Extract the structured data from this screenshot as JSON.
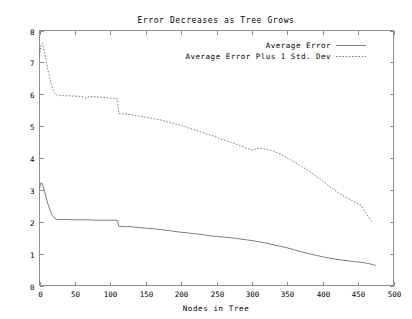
{
  "chart_data": {
    "type": "line",
    "title": "Error Decreases as Tree Grows",
    "xlabel": "Nodes in Tree",
    "ylabel": "",
    "xlim": [
      0,
      500
    ],
    "ylim": [
      0,
      8
    ],
    "xticks": [
      0,
      50,
      100,
      150,
      200,
      250,
      300,
      350,
      400,
      450,
      500
    ],
    "yticks": [
      0,
      1,
      2,
      3,
      4,
      5,
      6,
      7,
      8
    ],
    "grid": false,
    "legend_position": "top-right",
    "series": [
      {
        "name": "Average Error",
        "style": "solid",
        "color": "#6e6e6e",
        "x": [
          0,
          2,
          4,
          6,
          9,
          12,
          15,
          18,
          21,
          24,
          30,
          40,
          50,
          60,
          70,
          80,
          90,
          100,
          106,
          110,
          112,
          120,
          130,
          140,
          150,
          160,
          170,
          180,
          190,
          200,
          210,
          220,
          230,
          240,
          250,
          260,
          270,
          280,
          290,
          300,
          310,
          320,
          330,
          340,
          350,
          360,
          370,
          380,
          390,
          400,
          410,
          420,
          430,
          440,
          450,
          460,
          470,
          475
        ],
        "y": [
          3.05,
          3.22,
          3.2,
          3.05,
          2.8,
          2.55,
          2.35,
          2.2,
          2.12,
          2.08,
          2.07,
          2.07,
          2.06,
          2.06,
          2.06,
          2.05,
          2.05,
          2.05,
          2.05,
          2.04,
          1.86,
          1.85,
          1.84,
          1.82,
          1.8,
          1.78,
          1.76,
          1.73,
          1.7,
          1.67,
          1.65,
          1.62,
          1.6,
          1.56,
          1.54,
          1.52,
          1.5,
          1.47,
          1.44,
          1.41,
          1.37,
          1.33,
          1.28,
          1.23,
          1.18,
          1.12,
          1.06,
          1.0,
          0.95,
          0.9,
          0.86,
          0.82,
          0.79,
          0.76,
          0.74,
          0.71,
          0.66,
          0.63
        ]
      },
      {
        "name": "Average Error Plus 1 Std. Dev",
        "style": "dashed",
        "color": "#6e6e6e",
        "x": [
          0,
          2,
          4,
          6,
          9,
          12,
          15,
          18,
          21,
          24,
          30,
          40,
          50,
          60,
          65,
          70,
          80,
          90,
          100,
          106,
          110,
          112,
          120,
          130,
          140,
          150,
          160,
          170,
          180,
          190,
          200,
          210,
          220,
          230,
          240,
          250,
          255,
          260,
          270,
          280,
          290,
          300,
          310,
          320,
          330,
          340,
          350,
          360,
          370,
          380,
          390,
          400,
          410,
          420,
          430,
          440,
          450,
          455,
          460,
          470
        ],
        "y": [
          7.2,
          7.55,
          7.6,
          7.45,
          7.1,
          6.75,
          6.45,
          6.2,
          6.05,
          5.98,
          5.96,
          5.95,
          5.94,
          5.93,
          5.88,
          5.93,
          5.92,
          5.9,
          5.88,
          5.87,
          5.86,
          5.4,
          5.38,
          5.36,
          5.32,
          5.28,
          5.24,
          5.2,
          5.14,
          5.08,
          5.02,
          4.95,
          4.88,
          4.8,
          4.73,
          4.66,
          4.6,
          4.57,
          4.5,
          4.42,
          4.33,
          4.25,
          4.3,
          4.28,
          4.22,
          4.12,
          4.0,
          3.88,
          3.74,
          3.6,
          3.44,
          3.28,
          3.1,
          2.94,
          2.8,
          2.68,
          2.56,
          2.5,
          2.3,
          1.98
        ]
      }
    ]
  },
  "legend": {
    "entries": [
      {
        "label": "Average Error",
        "style": "solid"
      },
      {
        "label": "Average Error Plus 1 Std. Dev",
        "style": "dashed"
      }
    ]
  },
  "colors": {
    "frame": "#8f8f8f",
    "series": "#6e6e6e",
    "background": "#ffffff",
    "text": "#000000"
  }
}
